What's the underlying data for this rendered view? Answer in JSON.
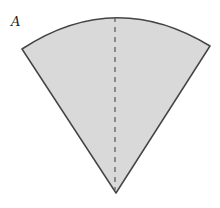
{
  "diagram": {
    "label": "A",
    "shape": "circular-sector",
    "fill_color": "#d9d9d9",
    "stroke_color": "#444444",
    "axis_line": "dashed"
  }
}
